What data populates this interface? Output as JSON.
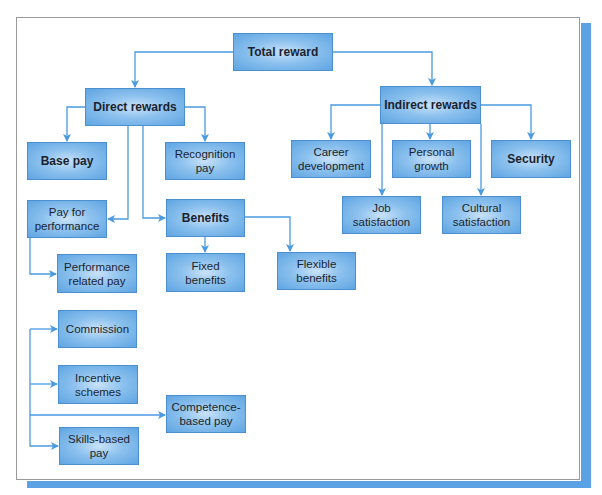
{
  "diagram": {
    "title_node": "Total reward",
    "colors": {
      "node_fill_center": "#c9e2f8",
      "node_fill_edge": "#5fa5e2",
      "node_border": "#4b8fd0",
      "connector": "#4a9ae0",
      "shadow": "#5aa2e4",
      "text": "#1b1f2e"
    },
    "nodes": {
      "total_reward": "Total reward",
      "direct_rewards": "Direct rewards",
      "indirect_rewards": "Indirect rewards",
      "base_pay": "Base pay",
      "recognition_pay": "Recognition pay",
      "pay_for_performance": "Pay for performance",
      "benefits": "Benefits",
      "fixed_benefits": "Fixed benefits",
      "flexible_benefits": "Flexible benefits",
      "performance_related_pay": "Performance related pay",
      "commission": "Commission",
      "incentive_schemes": "Incentive schemes",
      "competence_based_pay": "Competence-based pay",
      "skills_based_pay": "Skills-based pay",
      "career_development": "Career development",
      "personal_growth": "Personal growth",
      "security": "Security",
      "job_satisfaction": "Job satisfaction",
      "cultural_satisfaction": "Cultural satisfaction"
    },
    "edges": [
      [
        "Total reward",
        "Direct rewards"
      ],
      [
        "Total reward",
        "Indirect rewards"
      ],
      [
        "Direct rewards",
        "Base pay"
      ],
      [
        "Direct rewards",
        "Recognition pay"
      ],
      [
        "Direct rewards",
        "Pay for performance"
      ],
      [
        "Direct rewards",
        "Benefits"
      ],
      [
        "Benefits",
        "Fixed benefits"
      ],
      [
        "Benefits",
        "Flexible benefits"
      ],
      [
        "Pay for performance",
        "Performance related pay"
      ],
      [
        "Pay for performance",
        "Commission"
      ],
      [
        "Pay for performance",
        "Incentive schemes"
      ],
      [
        "Pay for performance",
        "Competence-based pay"
      ],
      [
        "Pay for performance",
        "Skills-based pay"
      ],
      [
        "Indirect rewards",
        "Career development"
      ],
      [
        "Indirect rewards",
        "Personal growth"
      ],
      [
        "Indirect rewards",
        "Security"
      ],
      [
        "Indirect rewards",
        "Job satisfaction"
      ],
      [
        "Indirect rewards",
        "Cultural satisfaction"
      ]
    ]
  }
}
